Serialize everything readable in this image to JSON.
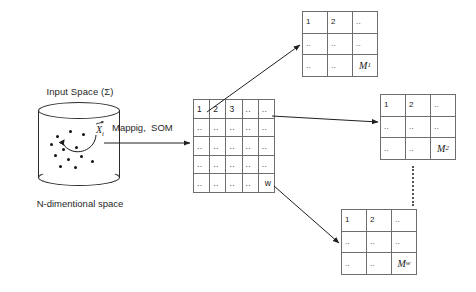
{
  "diagram": {
    "colors": {
      "background": "#ffffff",
      "stroke": "#2b2b2b",
      "grid_line": "#6e6e6e",
      "text": "#1f1f1f",
      "dot": "#121212"
    }
  },
  "input_space": {
    "label": "Input Space (Σ)",
    "caption": "N-dimentional space",
    "vector_label": "X",
    "vector_subscript": "i",
    "shape": "cylinder",
    "dot_count": 12
  },
  "mapping": {
    "label": "Mappig,  SOM"
  },
  "som_lattice": {
    "name": "som-lattice",
    "rows": 5,
    "cols": 5,
    "cells": [
      [
        "1",
        "2",
        "3",
        "..",
        ".."
      ],
      [
        "..",
        "..",
        "..",
        "..",
        ".."
      ],
      [
        "..",
        "..",
        "..",
        "..",
        ".."
      ],
      [
        "..",
        "..",
        "..",
        "..",
        ".."
      ],
      [
        "..",
        "..",
        "..",
        "..",
        "w"
      ]
    ]
  },
  "maps": [
    {
      "name": "map-1",
      "label": "M",
      "subscript": "1",
      "rows": 3,
      "cols": 3,
      "cells": [
        [
          "1",
          "2",
          ".."
        ],
        [
          "..",
          "..",
          ".."
        ],
        [
          "..",
          "..",
          "M₁"
        ]
      ]
    },
    {
      "name": "map-2",
      "label": "M",
      "subscript": "2",
      "rows": 3,
      "cols": 3,
      "cells": [
        [
          "1",
          "2",
          ".."
        ],
        [
          "..",
          "..",
          ".."
        ],
        [
          "..",
          "..",
          "M₂"
        ]
      ]
    },
    {
      "name": "map-w",
      "label": "M",
      "subscript": "w",
      "rows": 3,
      "cols": 3,
      "cells": [
        [
          "1",
          "2",
          ".."
        ],
        [
          "..",
          "..",
          ".."
        ],
        [
          "..",
          "..",
          "Mᵥ"
        ]
      ]
    }
  ],
  "connectors": [
    {
      "name": "arrow-input-to-lattice",
      "from": "input-space",
      "to": "som-lattice"
    },
    {
      "name": "arrow-lattice-to-map-1",
      "from": "som-lattice",
      "to": "map-1"
    },
    {
      "name": "arrow-lattice-to-map-2",
      "from": "som-lattice",
      "to": "map-2"
    },
    {
      "name": "arrow-lattice-to-map-w",
      "from": "som-lattice",
      "to": "map-w"
    }
  ],
  "ellipsis": {
    "name": "vertical-ellipsis",
    "symbol": "⋮"
  }
}
